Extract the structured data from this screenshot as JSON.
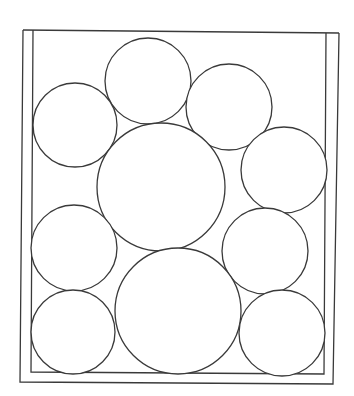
{
  "diagram": {
    "title": "",
    "type": "circle-packing-in-container",
    "stroke_color": "#3a3a3a",
    "background_color": "#ffffff",
    "container": {
      "outer": {
        "points": [
          [
            23,
            30
          ],
          [
            339,
            33
          ],
          [
            333,
            384
          ],
          [
            20,
            382
          ],
          [
            23,
            30
          ]
        ]
      },
      "inner": {
        "points": [
          [
            33,
            30
          ],
          [
            326,
            33
          ],
          [
            324,
            374
          ],
          [
            31,
            372
          ],
          [
            33,
            30
          ]
        ]
      },
      "open_top": true
    },
    "circles": [
      {
        "id": "top-center",
        "cx": 148,
        "cy": 81,
        "r": 43
      },
      {
        "id": "top-right",
        "cx": 229,
        "cy": 107,
        "r": 43
      },
      {
        "id": "upper-left",
        "cx": 75,
        "cy": 125,
        "r": 42
      },
      {
        "id": "large-center",
        "cx": 161,
        "cy": 187,
        "r": 64
      },
      {
        "id": "right-upper",
        "cx": 284,
        "cy": 170,
        "r": 43
      },
      {
        "id": "left-middle",
        "cx": 74,
        "cy": 248,
        "r": 43
      },
      {
        "id": "right-middle",
        "cx": 265,
        "cy": 251,
        "r": 43
      },
      {
        "id": "large-bottom",
        "cx": 178,
        "cy": 311,
        "r": 63
      },
      {
        "id": "bottom-left",
        "cx": 73,
        "cy": 332,
        "r": 42
      },
      {
        "id": "bottom-right",
        "cx": 282,
        "cy": 333,
        "r": 43
      }
    ],
    "circle_count": 10
  }
}
